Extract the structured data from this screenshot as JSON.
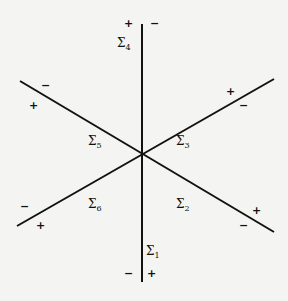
{
  "diagram": {
    "type": "six-sector partition of the plane by three lines through the origin",
    "center": [
      142,
      153
    ],
    "lines": [
      {
        "name": "vertical",
        "from": [
          142,
          24
        ],
        "to": [
          142,
          282
        ]
      },
      {
        "name": "diagonal-down",
        "from": [
          20,
          81
        ],
        "to": [
          274,
          232
        ]
      },
      {
        "name": "diagonal-up",
        "from": [
          17,
          226
        ],
        "to": [
          274,
          79
        ]
      }
    ],
    "regions": [
      {
        "id": "sigma1",
        "symbol": "Σ",
        "index": "1",
        "pos": [
          146,
          245
        ]
      },
      {
        "id": "sigma2",
        "symbol": "Σ",
        "index": "2",
        "pos": [
          176,
          198
        ]
      },
      {
        "id": "sigma3",
        "symbol": "Σ",
        "index": "3",
        "pos": [
          176,
          135
        ]
      },
      {
        "id": "sigma4",
        "symbol": "Σ",
        "index": "4",
        "pos": [
          117,
          37
        ]
      },
      {
        "id": "sigma5",
        "symbol": "Σ",
        "index": "5",
        "pos": [
          88,
          135
        ]
      },
      {
        "id": "sigma6",
        "symbol": "Σ",
        "index": "6",
        "pos": [
          88,
          198
        ]
      }
    ],
    "signs": [
      {
        "text": "+",
        "pos": [
          124,
          18
        ]
      },
      {
        "text": "−",
        "pos": [
          150,
          18
        ]
      },
      {
        "text": "−",
        "pos": [
          41,
          80
        ]
      },
      {
        "text": "+",
        "pos": [
          29,
          100
        ]
      },
      {
        "text": "+",
        "pos": [
          226,
          86
        ]
      },
      {
        "text": "−",
        "pos": [
          239,
          100
        ]
      },
      {
        "text": "−",
        "pos": [
          20,
          201
        ]
      },
      {
        "text": "+",
        "pos": [
          36,
          220
        ]
      },
      {
        "text": "+",
        "pos": [
          252,
          205
        ]
      },
      {
        "text": "−",
        "pos": [
          239,
          220
        ]
      },
      {
        "text": "−",
        "pos": [
          124,
          268
        ]
      },
      {
        "text": "+",
        "pos": [
          147,
          268
        ]
      }
    ]
  }
}
